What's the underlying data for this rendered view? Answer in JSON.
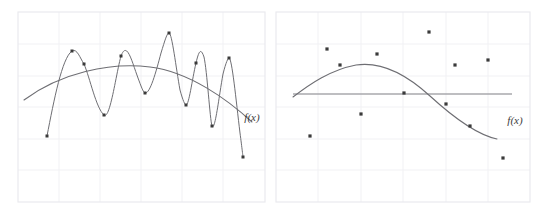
{
  "figure": {
    "background_color": "#ffffff",
    "panel_count": 2,
    "grid_color": "#f0f0f3",
    "frame_color": "#ebebee",
    "curve_color": "#6e6e73",
    "point_color": "#3a3a3a",
    "baseline_color": "#a8a8ad"
  },
  "panels": [
    {
      "id": "left",
      "name": "overfitting-panel",
      "curve_label": "f(x)",
      "description": "High-variance wiggly interpolating curve through all points with a smooth trend curve"
    },
    {
      "id": "right",
      "name": "underfitting-panel",
      "curve_label": "f(x)",
      "description": "Smooth parabolic curve and a flat horizontal line over a noisy scatter of points"
    }
  ],
  "chart_data": [
    {
      "type": "scatter",
      "title": "",
      "subtitle": "",
      "xlabel": "",
      "ylabel": "",
      "panel": "left",
      "grid": true,
      "legend": "none",
      "annotations": [
        {
          "text": "f(x)",
          "x": 252,
          "y": 117
        }
      ],
      "xlim": [
        18,
        265
      ],
      "ylim": [
        12,
        202
      ],
      "points": [
        {
          "x": 47,
          "y": 136
        },
        {
          "x": 72,
          "y": 51
        },
        {
          "x": 84,
          "y": 64
        },
        {
          "x": 104,
          "y": 115
        },
        {
          "x": 121,
          "y": 56
        },
        {
          "x": 145,
          "y": 93
        },
        {
          "x": 169,
          "y": 33
        },
        {
          "x": 186,
          "y": 105
        },
        {
          "x": 196,
          "y": 63
        },
        {
          "x": 212,
          "y": 126
        },
        {
          "x": 229,
          "y": 58
        },
        {
          "x": 243,
          "y": 157
        }
      ],
      "series": [
        {
          "name": "interpolating-curve",
          "style": "wiggly",
          "path": "M47,136 C54,100 62,58 72,51 C77,48 80,58 84,64 C90,78 96,108 104,115 C110,120 116,74 121,56 C127,40 132,62 138,78 C141,86 143,92 145,93 C150,94 156,72 161,53 C165,40 167,33 169,33 C172,33 176,68 180,90 C183,101 185,105 186,105 C189,105 192,80 196,63 C199,50 201,48 204,57 C207,70 210,120 212,126 C215,132 219,96 223,74 C226,62 228,58 229,58 C232,58 236,100 240,133 C242,148 243,157 243,157"
        },
        {
          "name": "trend-curve",
          "style": "smooth-arc",
          "path": "M24,100 C60,73 110,62 150,67 C190,72 228,100 252,122"
        }
      ]
    },
    {
      "type": "scatter",
      "title": "",
      "subtitle": "",
      "xlabel": "",
      "ylabel": "",
      "panel": "right",
      "grid": true,
      "legend": "none",
      "annotations": [
        {
          "text": "f(x)",
          "x": 512,
          "y": 120
        }
      ],
      "xlim": [
        276,
        530
      ],
      "ylim": [
        12,
        202
      ],
      "points": [
        {
          "x": 310,
          "y": 136
        },
        {
          "x": 327,
          "y": 49
        },
        {
          "x": 340,
          "y": 65
        },
        {
          "x": 361,
          "y": 114
        },
        {
          "x": 377,
          "y": 54
        },
        {
          "x": 429,
          "y": 32
        },
        {
          "x": 404,
          "y": 93
        },
        {
          "x": 446,
          "y": 104
        },
        {
          "x": 455,
          "y": 65
        },
        {
          "x": 470,
          "y": 126
        },
        {
          "x": 488,
          "y": 60
        },
        {
          "x": 503,
          "y": 158
        }
      ],
      "series": [
        {
          "name": "quadratic-fit-curve",
          "style": "smooth-parabola",
          "path": "M293,97 C310,84 330,70 356,65 C382,61 406,74 430,96 C454,118 478,135 497,139"
        },
        {
          "name": "constant-baseline",
          "style": "horizontal-line",
          "y": 94,
          "x_start": 293,
          "x_end": 512
        }
      ]
    }
  ]
}
